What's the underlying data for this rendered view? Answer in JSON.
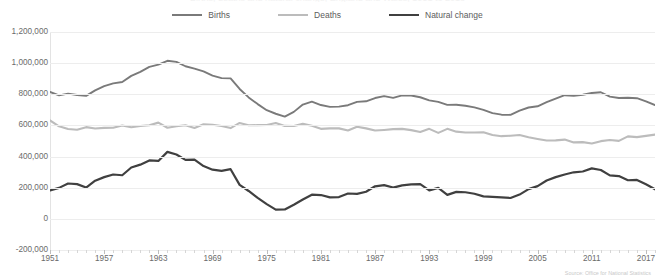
{
  "chart_title": "Births, deaths and natural change, England and Wales, 1951 to 2018",
  "source_note": "Source: Office for National Statistics",
  "colors": {
    "births": "#7a7a7a",
    "deaths": "#bcbcbc",
    "natural_change": "#404040",
    "gridline": "#ededed",
    "axis_text": "#6b6b6b"
  },
  "legend": {
    "position": "top-center",
    "entries": [
      {
        "label": "Births",
        "name": "legend-births",
        "color": "#7a7a7a"
      },
      {
        "label": "Deaths",
        "name": "legend-deaths",
        "color": "#bcbcbc"
      },
      {
        "label": "Natural change",
        "name": "legend-natural-change",
        "color": "#404040"
      }
    ]
  },
  "yaxis": {
    "labels": [
      "1,200,000",
      "1,000,000",
      "800,000",
      "600,000",
      "400,000",
      "200,000",
      "0",
      "-200,000"
    ],
    "min": -200000,
    "max": 1200000,
    "step": 200000
  },
  "xaxis": {
    "labels": [
      "1951",
      "1957",
      "1963",
      "1969",
      "1975",
      "1981",
      "1987",
      "1993",
      "1999",
      "2005",
      "2011",
      "2017"
    ],
    "min": 1951,
    "max": 2018,
    "label_step": 6,
    "tick_step": 1
  },
  "chart_data": {
    "type": "line",
    "title": "Births, deaths and natural change, England and Wales, 1951 to 2018",
    "xlabel": "",
    "ylabel": "",
    "ylim": [
      -200000,
      1200000
    ],
    "xlim": [
      1951,
      2018
    ],
    "grid": true,
    "legend_position": "top-center",
    "x": [
      1951,
      1952,
      1953,
      1954,
      1955,
      1956,
      1957,
      1958,
      1959,
      1960,
      1961,
      1962,
      1963,
      1964,
      1965,
      1966,
      1967,
      1968,
      1969,
      1970,
      1971,
      1972,
      1973,
      1974,
      1975,
      1976,
      1977,
      1978,
      1979,
      1980,
      1981,
      1982,
      1983,
      1984,
      1985,
      1986,
      1987,
      1988,
      1989,
      1990,
      1991,
      1992,
      1993,
      1994,
      1995,
      1996,
      1997,
      1998,
      1999,
      2000,
      2001,
      2002,
      2003,
      2004,
      2005,
      2006,
      2007,
      2008,
      2009,
      2010,
      2011,
      2012,
      2013,
      2014,
      2015,
      2016,
      2017,
      2018
    ],
    "series": [
      {
        "name": "Births",
        "color": "#7a7a7a",
        "values": [
          815000,
          793000,
          804000,
          795000,
          790000,
          825000,
          852000,
          870000,
          879000,
          918000,
          944000,
          976000,
          990000,
          1015000,
          1008000,
          980000,
          965000,
          947000,
          920000,
          904000,
          902000,
          834000,
          780000,
          737000,
          698000,
          675000,
          657000,
          687000,
          734000,
          753000,
          731000,
          719000,
          721000,
          730000,
          751000,
          755000,
          776000,
          788000,
          777000,
          793000,
          792000,
          781000,
          761000,
          751000,
          732000,
          733000,
          726000,
          716000,
          700000,
          679000,
          669000,
          668000,
          695000,
          715000,
          723000,
          749000,
          772000,
          794000,
          790000,
          797000,
          808000,
          813000,
          785000,
          776000,
          778000,
          775000,
          755000,
          731000
        ]
      },
      {
        "name": "Deaths",
        "color": "#bcbcbc",
        "values": [
          632000,
          594000,
          577000,
          572000,
          589000,
          580000,
          584000,
          585000,
          599000,
          588000,
          596000,
          601000,
          618000,
          585000,
          595000,
          601000,
          584000,
          608000,
          604000,
          596000,
          583000,
          616000,
          601000,
          602000,
          603000,
          616000,
          597000,
          596000,
          610000,
          598000,
          578000,
          581000,
          581000,
          567000,
          591000,
          581000,
          567000,
          571000,
          576000,
          578000,
          570000,
          558000,
          578000,
          552000,
          578000,
          560000,
          555000,
          555000,
          556000,
          538000,
          531000,
          534000,
          539000,
          524000,
          513000,
          503000,
          504000,
          509000,
          491000,
          493000,
          484000,
          499000,
          506000,
          501000,
          530000,
          525000,
          533000,
          541000
        ]
      },
      {
        "name": "Natural change",
        "color": "#404040",
        "values": [
          183000,
          199000,
          227000,
          223000,
          201000,
          245000,
          268000,
          285000,
          280000,
          330000,
          348000,
          375000,
          372000,
          430000,
          413000,
          379000,
          381000,
          339000,
          316000,
          308000,
          319000,
          218000,
          179000,
          135000,
          95000,
          59000,
          60000,
          91000,
          124000,
          155000,
          153000,
          138000,
          140000,
          163000,
          160000,
          174000,
          209000,
          217000,
          201000,
          215000,
          222000,
          223000,
          183000,
          199000,
          154000,
          173000,
          171000,
          161000,
          144000,
          141000,
          138000,
          134000,
          156000,
          191000,
          210000,
          246000,
          268000,
          285000,
          299000,
          304000,
          324000,
          314000,
          279000,
          275000,
          248000,
          250000,
          222000,
          190000
        ]
      }
    ]
  }
}
